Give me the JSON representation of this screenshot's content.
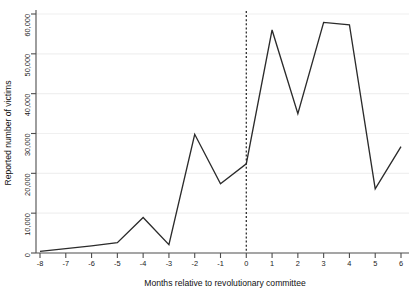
{
  "chart_data": {
    "type": "line",
    "title": "",
    "xlabel": "Months relative to revolutionary committee",
    "ylabel": "Reported number of victims",
    "x": [
      -8,
      -7,
      -6,
      -5,
      -4,
      -3,
      -2,
      -1,
      0,
      1,
      2,
      3,
      4,
      5,
      6
    ],
    "values": [
      400,
      1100,
      1800,
      2600,
      8900,
      2100,
      29800,
      17400,
      22400,
      56000,
      35000,
      57900,
      57300,
      16100,
      26700
    ],
    "series": [
      {
        "name": "Reported number of victims",
        "values": [
          400,
          1100,
          1800,
          2600,
          8900,
          2100,
          29800,
          17400,
          22400,
          56000,
          35000,
          57900,
          57300,
          16100,
          26700
        ]
      }
    ],
    "xlim": [
      -8,
      6
    ],
    "ylim": [
      0,
      62000
    ],
    "xticks": [
      -8,
      -7,
      -6,
      -5,
      -4,
      -3,
      -2,
      -1,
      0,
      1,
      2,
      3,
      4,
      5,
      6
    ],
    "xticklabels": [
      "-8",
      "-7",
      "-6",
      "-5",
      "-4",
      "-3",
      "-2",
      "-1",
      "0",
      "1",
      "2",
      "3",
      "4",
      "5",
      "6"
    ],
    "yticks": [
      0,
      10000,
      20000,
      30000,
      40000,
      50000,
      60000
    ],
    "yticklabels": [
      "0",
      "10,000",
      "20,000",
      "30,000",
      "40,000",
      "50,000",
      "60,000"
    ],
    "grid": "horizontal",
    "legend": "none",
    "annotations": [
      {
        "type": "vertical-reference-line",
        "x": 0,
        "style": "dashed",
        "name": "event-time-zero-line"
      }
    ],
    "colors": {
      "series": "#2b2b2b",
      "axis": "#4d4d4d",
      "grid": "#f0f0f0",
      "reference_line": "#1f1f1f",
      "background": "#ffffff"
    }
  }
}
